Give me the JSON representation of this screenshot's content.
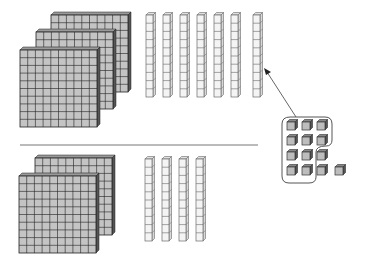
{
  "diagram": {
    "colors": {
      "flat_fill": "#c4c4c4",
      "flat_side": "#555555",
      "grid_line": "#222222",
      "rod_fill": "#f4f4f4",
      "rod_line": "#6a6a6a",
      "cube_fill": "#bdbdbd",
      "divider": "#777777",
      "arrow": "#555555"
    },
    "top_section": {
      "hundreds": 3,
      "tens": 7,
      "ones": 13,
      "flats": [
        {
          "x": 51,
          "y": 15
        },
        {
          "x": 36,
          "y": 32
        },
        {
          "x": 20,
          "y": 50
        }
      ],
      "rods_x": [
        146,
        163,
        180,
        197,
        214,
        231,
        253
      ],
      "rod_top": 15,
      "ones_grouped": 10,
      "ones_remaining": 3
    },
    "bottom_section": {
      "hundreds": 2,
      "tens": 4,
      "flats": [
        {
          "x": 35,
          "y": 158
        },
        {
          "x": 19,
          "y": 176
        }
      ],
      "rods_x": [
        145,
        162,
        179,
        196
      ],
      "rod_top": 159
    },
    "annotation": "Ten ones regrouped into one ten (arrow points to new rod)"
  }
}
